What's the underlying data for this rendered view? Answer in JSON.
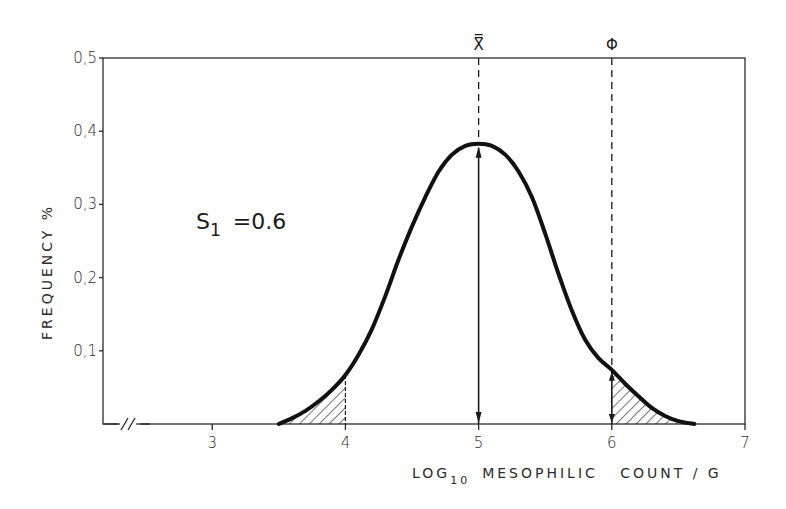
{
  "chart_data": {
    "type": "line",
    "title": "",
    "xlabel": "LOG10 MESOPHILIC COUNT / G",
    "xlabel_parts": {
      "pre": "LOG",
      "sub": "10",
      "post": "MESOPHILIC   COUNT / G"
    },
    "ylabel": "FREQUENCY %",
    "xlim": [
      2.18,
      7.0
    ],
    "ylim": [
      0,
      0.5
    ],
    "x_axis_break": true,
    "grid": false,
    "legend": null,
    "x_ticks": [
      3,
      4,
      5,
      6,
      7
    ],
    "x_tick_labels": [
      "3",
      "4",
      "5",
      "6",
      "7"
    ],
    "y_ticks": [
      0.1,
      0.2,
      0.3,
      0.4,
      0.5
    ],
    "y_tick_labels": [
      "0,1",
      "0,2",
      "0,3",
      "0,4",
      "0,5"
    ],
    "series": [
      {
        "name": "frequency distribution",
        "x": [
          3.5,
          3.6,
          3.7,
          3.8,
          3.9,
          4.0,
          4.1,
          4.2,
          4.3,
          4.4,
          4.5,
          4.6,
          4.7,
          4.8,
          4.9,
          5.0,
          5.1,
          5.2,
          5.3,
          5.4,
          5.5,
          5.6,
          5.7,
          5.8,
          5.9,
          6.0,
          6.1,
          6.2,
          6.3,
          6.4,
          6.5,
          6.62
        ],
        "y": [
          0.0,
          0.008,
          0.018,
          0.031,
          0.047,
          0.067,
          0.095,
          0.13,
          0.175,
          0.225,
          0.27,
          0.31,
          0.345,
          0.368,
          0.38,
          0.383,
          0.38,
          0.368,
          0.345,
          0.31,
          0.26,
          0.205,
          0.155,
          0.115,
          0.09,
          0.074,
          0.055,
          0.038,
          0.022,
          0.011,
          0.004,
          0.0
        ]
      }
    ],
    "shaded_regions": [
      {
        "x_from": 3.5,
        "x_to": 4.0,
        "pattern": "hatched"
      },
      {
        "x_from": 6.0,
        "x_to": 6.62,
        "pattern": "hatched"
      }
    ],
    "reference_lines": [
      {
        "label": "X̿",
        "x": 5.0,
        "style": "dashed",
        "arrow_solid_to_peak": true
      },
      {
        "label": "Φ",
        "x": 6.0,
        "style": "dashed"
      }
    ],
    "annotations": [
      {
        "text": "S1 =0.6",
        "main": "S",
        "sub": "1",
        "rest": "=0.6",
        "x": 3.3,
        "y": 0.27
      }
    ]
  }
}
